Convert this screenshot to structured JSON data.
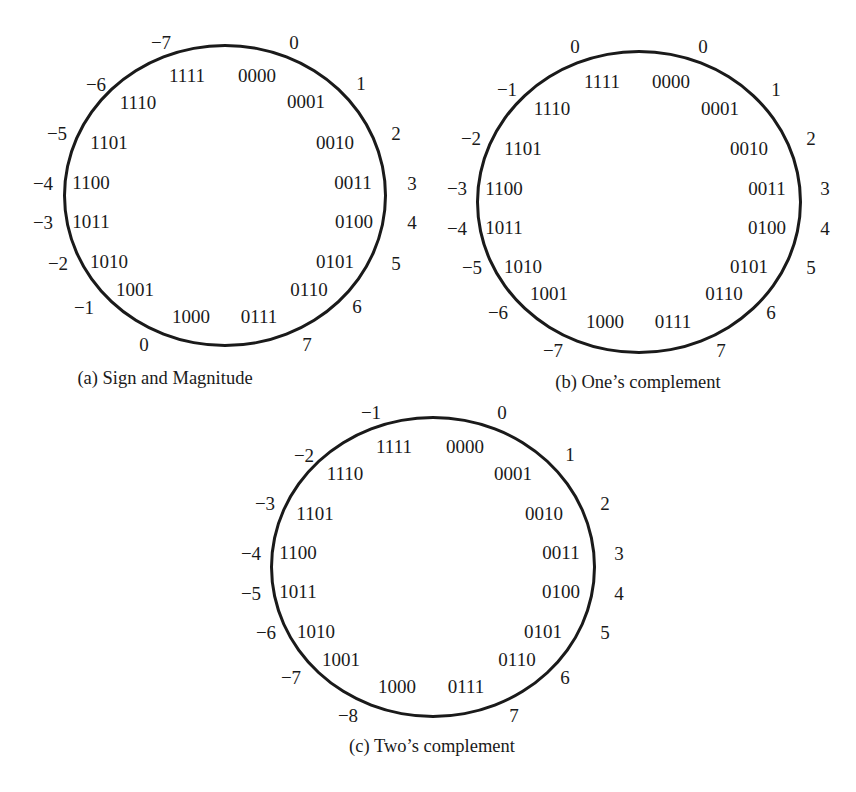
{
  "figure": {
    "diagrams": [
      {
        "id": "a",
        "caption": "(a) Sign and Magnitude",
        "codes": [
          "0000",
          "0001",
          "0010",
          "0011",
          "0100",
          "0101",
          "0110",
          "0111",
          "1000",
          "1001",
          "1010",
          "1011",
          "1100",
          "1101",
          "1110",
          "1111"
        ],
        "outer_values": {
          "0000": "0",
          "0001": "1",
          "0010": "2",
          "0011": "3",
          "0100": "4",
          "0101": "5",
          "0110": "6",
          "0111": "7",
          "1000": "0",
          "1001": "−1",
          "1010": "−2",
          "1011": "−3",
          "1100": "−4",
          "1101": "−5",
          "1110": "−6",
          "1111": "−7"
        }
      },
      {
        "id": "b",
        "caption": "(b) One’s complement",
        "codes": [
          "0000",
          "0001",
          "0010",
          "0011",
          "0100",
          "0101",
          "0110",
          "0111",
          "1000",
          "1001",
          "1010",
          "1011",
          "1100",
          "1101",
          "1110",
          "1111"
        ],
        "outer_values": {
          "0000": "0",
          "0001": "1",
          "0010": "2",
          "0011": "3",
          "0100": "4",
          "0101": "5",
          "0110": "6",
          "0111": "7",
          "1000": "−7",
          "1001": "−6",
          "1010": "−5",
          "1011": "−4",
          "1100": "−3",
          "1101": "−2",
          "1110": "−1",
          "1111": "0"
        }
      },
      {
        "id": "c",
        "caption": "(c) Two’s complement",
        "codes": [
          "0000",
          "0001",
          "0010",
          "0011",
          "0100",
          "0101",
          "0110",
          "0111",
          "1000",
          "1001",
          "1010",
          "1011",
          "1100",
          "1101",
          "1110",
          "1111"
        ],
        "outer_values": {
          "0000": "0",
          "0001": "1",
          "0010": "2",
          "0011": "3",
          "0100": "4",
          "0101": "5",
          "0110": "6",
          "0111": "7",
          "1000": "−8",
          "1001": "−7",
          "1010": "−6",
          "1011": "−5",
          "1100": "−4",
          "1101": "−3",
          "1110": "−2",
          "1111": "−1"
        }
      }
    ]
  },
  "labels": {
    "a": {
      "caption": "(a) Sign and Magnitude",
      "c0000": "0000",
      "c0001": "0001",
      "c0010": "0010",
      "c0011": "0011",
      "c0100": "0100",
      "c0101": "0101",
      "c0110": "0110",
      "c0111": "0111",
      "c1000": "1000",
      "c1001": "1001",
      "c1010": "1010",
      "c1011": "1011",
      "c1100": "1100",
      "c1101": "1101",
      "c1110": "1110",
      "c1111": "1111",
      "v0000": "0",
      "v0001": "1",
      "v0010": "2",
      "v0011": "3",
      "v0100": "4",
      "v0101": "5",
      "v0110": "6",
      "v0111": "7",
      "v1000": "0",
      "v1001": "−1",
      "v1010": "−2",
      "v1011": "−3",
      "v1100": "−4",
      "v1101": "−5",
      "v1110": "−6",
      "v1111": "−7"
    },
    "b": {
      "caption": "(b) One’s complement",
      "c0000": "0000",
      "c0001": "0001",
      "c0010": "0010",
      "c0011": "0011",
      "c0100": "0100",
      "c0101": "0101",
      "c0110": "0110",
      "c0111": "0111",
      "c1000": "1000",
      "c1001": "1001",
      "c1010": "1010",
      "c1011": "1011",
      "c1100": "1100",
      "c1101": "1101",
      "c1110": "1110",
      "c1111": "1111",
      "v0000": "0",
      "v0001": "1",
      "v0010": "2",
      "v0011": "3",
      "v0100": "4",
      "v0101": "5",
      "v0110": "6",
      "v0111": "7",
      "v1000": "−7",
      "v1001": "−6",
      "v1010": "−5",
      "v1011": "−4",
      "v1100": "−3",
      "v1101": "−2",
      "v1110": "−1",
      "v1111": "0"
    },
    "c": {
      "caption": "(c) Two’s complement",
      "c0000": "0000",
      "c0001": "0001",
      "c0010": "0010",
      "c0011": "0011",
      "c0100": "0100",
      "c0101": "0101",
      "c0110": "0110",
      "c0111": "0111",
      "c1000": "1000",
      "c1001": "1001",
      "c1010": "1010",
      "c1011": "1011",
      "c1100": "1100",
      "c1101": "1101",
      "c1110": "1110",
      "c1111": "1111",
      "v0000": "0",
      "v0001": "1",
      "v0010": "2",
      "v0011": "3",
      "v0100": "4",
      "v0101": "5",
      "v0110": "6",
      "v0111": "7",
      "v1000": "−8",
      "v1001": "−7",
      "v1010": "−6",
      "v1011": "−5",
      "v1100": "−4",
      "v1101": "−3",
      "v1110": "−2",
      "v1111": "−1"
    }
  }
}
